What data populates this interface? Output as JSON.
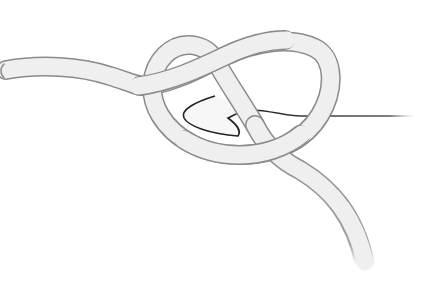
{
  "illustration": {
    "subject": "slip knot on crochet hook",
    "colors": {
      "background": "#ffffff",
      "yarn_fill": "#efefef",
      "yarn_outline": "#8a8a8a",
      "hook_outline": "#222222",
      "hook_fill": "#ffffff"
    }
  }
}
